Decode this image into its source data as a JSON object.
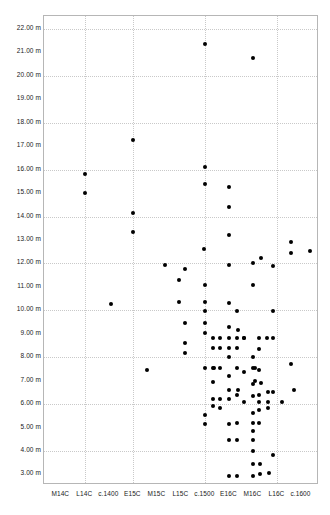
{
  "chart_data": {
    "type": "scatter",
    "title": "",
    "xlabel": "",
    "ylabel": "",
    "grid": true,
    "legend": null,
    "ylim": [
      2.55,
      22.55
    ],
    "y_unit": "m",
    "y_ticks": [
      3,
      4,
      5,
      6,
      7,
      8,
      9,
      10,
      11,
      12,
      13,
      14,
      15,
      16,
      17,
      18,
      19,
      20,
      21,
      22
    ],
    "y_tick_labels": [
      "3.00 m",
      "4.00 m",
      "5.00 m",
      "6.00 m",
      "7.00 m",
      "8.00 m",
      "9.00 m",
      "10.00 m",
      "11.00 m",
      "12.00 m",
      "13.00 m",
      "14.00 m",
      "15.00 m",
      "16.00 m",
      "17.00 m",
      "18.00 m",
      "19.00 m",
      "20.00 m",
      "21.00 m",
      "22.00 m"
    ],
    "y_gridline_values": [
      4,
      6,
      8,
      10,
      12,
      14,
      16,
      18,
      20,
      22
    ],
    "x_categories": [
      "M14C",
      "L14C",
      "c.1400",
      "E15C",
      "M15C",
      "L15C",
      "c.1500",
      "E16C",
      "M16C",
      "L16C",
      "c.1600"
    ],
    "x_gridline_categories": [
      "L14C",
      "E15C",
      "c.1500",
      "L16C"
    ],
    "point_color": "#000000",
    "points": [
      {
        "x": 1.0,
        "y": 15.8
      },
      {
        "x": 1.0,
        "y": 15.0
      },
      {
        "x": 2.05,
        "y": 10.25
      },
      {
        "x": 3.0,
        "y": 17.25
      },
      {
        "x": 3.0,
        "y": 14.15
      },
      {
        "x": 3.0,
        "y": 13.35
      },
      {
        "x": 3.55,
        "y": 7.45
      },
      {
        "x": 4.3,
        "y": 11.95
      },
      {
        "x": 4.9,
        "y": 11.3
      },
      {
        "x": 4.9,
        "y": 10.35
      },
      {
        "x": 5.15,
        "y": 11.75
      },
      {
        "x": 5.15,
        "y": 9.45
      },
      {
        "x": 5.15,
        "y": 8.6
      },
      {
        "x": 5.15,
        "y": 8.2
      },
      {
        "x": 5.95,
        "y": 12.6
      },
      {
        "x": 6.0,
        "y": 21.35
      },
      {
        "x": 6.0,
        "y": 16.1
      },
      {
        "x": 6.0,
        "y": 15.4
      },
      {
        "x": 6.0,
        "y": 11.1
      },
      {
        "x": 6.0,
        "y": 10.35
      },
      {
        "x": 6.0,
        "y": 9.95
      },
      {
        "x": 6.0,
        "y": 9.45
      },
      {
        "x": 6.0,
        "y": 9.05
      },
      {
        "x": 6.0,
        "y": 7.55
      },
      {
        "x": 6.0,
        "y": 5.55
      },
      {
        "x": 6.0,
        "y": 5.15
      },
      {
        "x": 6.3,
        "y": 8.8
      },
      {
        "x": 6.3,
        "y": 8.4
      },
      {
        "x": 6.3,
        "y": 7.55
      },
      {
        "x": 6.3,
        "y": 6.95
      },
      {
        "x": 6.3,
        "y": 6.2
      },
      {
        "x": 6.3,
        "y": 5.9
      },
      {
        "x": 6.35,
        "y": 7.55
      },
      {
        "x": 6.62,
        "y": 8.8
      },
      {
        "x": 6.62,
        "y": 8.4
      },
      {
        "x": 6.62,
        "y": 7.55
      },
      {
        "x": 6.62,
        "y": 6.2
      },
      {
        "x": 6.62,
        "y": 5.85
      },
      {
        "x": 7.0,
        "y": 15.25
      },
      {
        "x": 7.0,
        "y": 14.4
      },
      {
        "x": 7.0,
        "y": 13.2
      },
      {
        "x": 7.0,
        "y": 11.95
      },
      {
        "x": 7.0,
        "y": 10.3
      },
      {
        "x": 7.0,
        "y": 9.3
      },
      {
        "x": 7.0,
        "y": 8.8
      },
      {
        "x": 7.0,
        "y": 8.4
      },
      {
        "x": 7.0,
        "y": 8.0
      },
      {
        "x": 7.0,
        "y": 7.2
      },
      {
        "x": 7.0,
        "y": 6.6
      },
      {
        "x": 7.0,
        "y": 6.2
      },
      {
        "x": 7.0,
        "y": 5.15
      },
      {
        "x": 7.0,
        "y": 4.45
      },
      {
        "x": 7.0,
        "y": 2.95
      },
      {
        "x": 7.3,
        "y": 9.95
      },
      {
        "x": 7.3,
        "y": 8.8
      },
      {
        "x": 7.3,
        "y": 8.4
      },
      {
        "x": 7.3,
        "y": 7.55
      },
      {
        "x": 7.3,
        "y": 6.4
      },
      {
        "x": 7.3,
        "y": 5.2
      },
      {
        "x": 7.3,
        "y": 4.45
      },
      {
        "x": 7.3,
        "y": 2.95
      },
      {
        "x": 7.35,
        "y": 9.15
      },
      {
        "x": 7.35,
        "y": 6.6
      },
      {
        "x": 7.6,
        "y": 8.8
      },
      {
        "x": 7.6,
        "y": 7.35
      },
      {
        "x": 7.6,
        "y": 6.1
      },
      {
        "x": 7.62,
        "y": 8.8
      },
      {
        "x": 8.0,
        "y": 20.75
      },
      {
        "x": 8.0,
        "y": 12.0
      },
      {
        "x": 8.0,
        "y": 11.1
      },
      {
        "x": 8.0,
        "y": 8.0
      },
      {
        "x": 8.0,
        "y": 7.55
      },
      {
        "x": 8.0,
        "y": 6.85
      },
      {
        "x": 8.0,
        "y": 6.35
      },
      {
        "x": 8.0,
        "y": 5.6
      },
      {
        "x": 8.0,
        "y": 5.2
      },
      {
        "x": 8.0,
        "y": 4.85
      },
      {
        "x": 8.0,
        "y": 4.45
      },
      {
        "x": 8.0,
        "y": 4.0
      },
      {
        "x": 8.0,
        "y": 3.45
      },
      {
        "x": 8.0,
        "y": 2.95
      },
      {
        "x": 8.05,
        "y": 7.55
      },
      {
        "x": 8.05,
        "y": 7.0
      },
      {
        "x": 8.25,
        "y": 8.8
      },
      {
        "x": 8.25,
        "y": 8.35
      },
      {
        "x": 8.25,
        "y": 7.45
      },
      {
        "x": 8.25,
        "y": 6.4
      },
      {
        "x": 8.25,
        "y": 6.1
      },
      {
        "x": 8.25,
        "y": 5.75
      },
      {
        "x": 8.25,
        "y": 5.2
      },
      {
        "x": 8.28,
        "y": 3.45
      },
      {
        "x": 8.28,
        "y": 3.0
      },
      {
        "x": 8.3,
        "y": 12.25
      },
      {
        "x": 8.3,
        "y": 6.9
      },
      {
        "x": 8.55,
        "y": 8.8
      },
      {
        "x": 8.6,
        "y": 6.5
      },
      {
        "x": 8.6,
        "y": 6.1
      },
      {
        "x": 8.6,
        "y": 5.85
      },
      {
        "x": 8.65,
        "y": 3.05
      },
      {
        "x": 8.8,
        "y": 11.9
      },
      {
        "x": 8.8,
        "y": 9.95
      },
      {
        "x": 8.8,
        "y": 8.8
      },
      {
        "x": 8.8,
        "y": 6.5
      },
      {
        "x": 8.8,
        "y": 3.85
      },
      {
        "x": 9.2,
        "y": 6.1
      },
      {
        "x": 9.55,
        "y": 12.9
      },
      {
        "x": 9.55,
        "y": 12.45
      },
      {
        "x": 9.58,
        "y": 7.7
      },
      {
        "x": 9.7,
        "y": 6.6
      },
      {
        "x": 10.35,
        "y": 12.55
      }
    ]
  }
}
